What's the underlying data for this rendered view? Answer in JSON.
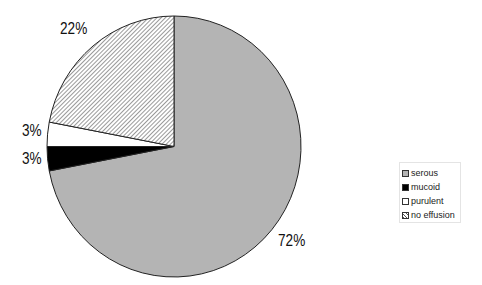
{
  "chart_data": {
    "type": "pie",
    "title": "",
    "categories": [
      "serous",
      "mucoid",
      "purulent",
      "no effusion"
    ],
    "values": [
      72,
      3,
      3,
      22
    ],
    "labels": [
      "72%",
      "3%",
      "3%",
      "22%"
    ],
    "start_angle": "12 o'clock, clockwise",
    "legend_position": "right",
    "fills": {
      "serous": "#b4b4b4",
      "mucoid": "#000000",
      "purulent": "#ffffff",
      "no effusion": "diagonal hatch"
    }
  },
  "labels": {
    "serous": "72%",
    "mucoid": "3%",
    "purulent": "3%",
    "no_effusion": "22%"
  },
  "legend": {
    "items": [
      {
        "label": "serous"
      },
      {
        "label": "mucoid"
      },
      {
        "label": "purulent"
      },
      {
        "label": "no effusion"
      }
    ]
  }
}
